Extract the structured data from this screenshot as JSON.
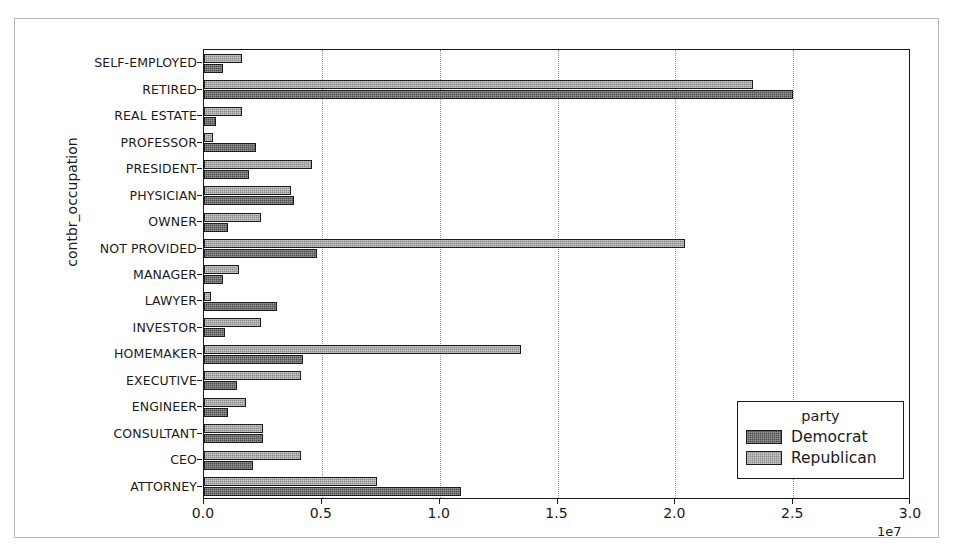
{
  "chart_data": {
    "type": "bar",
    "orientation": "horizontal",
    "grouped": true,
    "title": "",
    "xlabel": "",
    "ylabel": "contbr_occupation",
    "x_offset_label": "1e7",
    "xlim": [
      0,
      30000000
    ],
    "xticks": [
      0,
      5000000,
      10000000,
      15000000,
      20000000,
      25000000,
      30000000
    ],
    "xtick_labels": [
      "0.0",
      "0.5",
      "1.0",
      "1.5",
      "2.0",
      "2.5",
      "3.0"
    ],
    "grid": "x-dotted",
    "legend": {
      "title": "party",
      "position": "lower-right",
      "entries": [
        {
          "label": "Democrat",
          "color": "#4e4e4e"
        },
        {
          "label": "Republican",
          "color": "#8c8c8c"
        }
      ]
    },
    "categories": [
      "SELF-EMPLOYED",
      "RETIRED",
      "REAL ESTATE",
      "PROFESSOR",
      "PRESIDENT",
      "PHYSICIAN",
      "OWNER",
      "NOT PROVIDED",
      "MANAGER",
      "LAWYER",
      "INVESTOR",
      "HOMEMAKER",
      "EXECUTIVE",
      "ENGINEER",
      "CONSULTANT",
      "CEO",
      "ATTORNEY"
    ],
    "series": [
      {
        "name": "Republican",
        "color": "#8c8c8c",
        "values": [
          1600000,
          23300000,
          1600000,
          400000,
          4600000,
          3700000,
          2400000,
          20400000,
          1500000,
          300000,
          2400000,
          13450000,
          4100000,
          1800000,
          2500000,
          4100000,
          7350000
        ]
      },
      {
        "name": "Democrat",
        "color": "#4e4e4e",
        "values": [
          800000,
          25000000,
          500000,
          2200000,
          1900000,
          3800000,
          1000000,
          4800000,
          800000,
          3100000,
          900000,
          4200000,
          1400000,
          1000000,
          2500000,
          2100000,
          10900000
        ]
      }
    ]
  }
}
